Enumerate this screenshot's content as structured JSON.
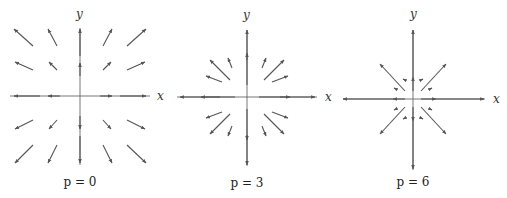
{
  "figure": {
    "color": "#555555",
    "panels": [
      {
        "caption": "p = 0",
        "x_label": "x",
        "y_label": "y",
        "origin": [
          80,
          96
        ],
        "x_axis": [
          10,
          150
        ],
        "y_axis": [
          28,
          165
        ],
        "label_pos": {
          "x": [
            157,
            100
          ],
          "y": [
            76,
            18
          ],
          "caption": [
            80,
            186
          ]
        },
        "vectors": [
          [
            33,
            46,
            14,
            29
          ],
          [
            57,
            46,
            48,
            29
          ],
          [
            103,
            46,
            112,
            29
          ],
          [
            127,
            46,
            146,
            29
          ],
          [
            33,
            70,
            15,
            62
          ],
          [
            57,
            70,
            49,
            62
          ],
          [
            103,
            70,
            111,
            62
          ],
          [
            127,
            70,
            145,
            62
          ],
          [
            33,
            120,
            15,
            129
          ],
          [
            57,
            120,
            49,
            129
          ],
          [
            103,
            120,
            111,
            129
          ],
          [
            127,
            120,
            145,
            129
          ],
          [
            33,
            145,
            15,
            163
          ],
          [
            57,
            145,
            48,
            163
          ],
          [
            103,
            145,
            112,
            163
          ],
          [
            127,
            145,
            146,
            163
          ],
          [
            60,
            96,
            48,
            96
          ],
          [
            40,
            96,
            14,
            96
          ],
          [
            100,
            96,
            112,
            96
          ],
          [
            120,
            96,
            146,
            96
          ],
          [
            80,
            76,
            80,
            63
          ],
          [
            80,
            56,
            80,
            29
          ],
          [
            80,
            116,
            80,
            129
          ],
          [
            80,
            136,
            80,
            163
          ]
        ]
      },
      {
        "caption": "p = 3",
        "x_label": "x",
        "y_label": "y",
        "origin": [
          247,
          97
        ],
        "x_axis": [
          177,
          317
        ],
        "y_axis": [
          30,
          166
        ],
        "label_pos": {
          "x": [
            325,
            101
          ],
          "y": [
            243,
            19
          ],
          "caption": [
            247,
            187
          ]
        },
        "vectors": [
          [
            230,
            80,
            210,
            60
          ],
          [
            232,
            68,
            228,
            58
          ],
          [
            222,
            82,
            206,
            76
          ],
          [
            264,
            80,
            284,
            60
          ],
          [
            262,
            68,
            266,
            58
          ],
          [
            272,
            82,
            288,
            76
          ],
          [
            230,
            114,
            210,
            134
          ],
          [
            232,
            126,
            228,
            136
          ],
          [
            222,
            112,
            206,
            118
          ],
          [
            264,
            114,
            284,
            134
          ],
          [
            262,
            126,
            266,
            136
          ],
          [
            272,
            112,
            288,
            118
          ],
          [
            235,
            97,
            201,
            97
          ],
          [
            220,
            97,
            180,
            97
          ],
          [
            259,
            97,
            290,
            97
          ],
          [
            280,
            97,
            315,
            97
          ],
          [
            247,
            85,
            247,
            53
          ],
          [
            247,
            60,
            247,
            30
          ],
          [
            247,
            109,
            247,
            140
          ],
          [
            247,
            135,
            247,
            165
          ]
        ]
      },
      {
        "caption": "p = 6",
        "x_label": "x",
        "y_label": "y",
        "origin": [
          413,
          99
        ],
        "x_axis": [
          343,
          485
        ],
        "y_axis": [
          30,
          170
        ],
        "label_pos": {
          "x": [
            493,
            103
          ],
          "y": [
            410,
            18
          ],
          "caption": [
            413,
            186
          ]
        },
        "vectors": [
          [
            405,
            91,
            380,
            64
          ],
          [
            405,
            80,
            403,
            79
          ],
          [
            396,
            89,
            394,
            88
          ],
          [
            421,
            91,
            446,
            64
          ],
          [
            421,
            80,
            423,
            79
          ],
          [
            430,
            89,
            432,
            88
          ],
          [
            405,
            107,
            380,
            134
          ],
          [
            405,
            118,
            403,
            119
          ],
          [
            396,
            109,
            394,
            110
          ],
          [
            421,
            107,
            446,
            134
          ],
          [
            421,
            118,
            423,
            119
          ],
          [
            430,
            109,
            432,
            110
          ],
          [
            405,
            99,
            393,
            99
          ],
          [
            393,
            99,
            343,
            99
          ],
          [
            421,
            99,
            436,
            99
          ],
          [
            436,
            99,
            484,
            99
          ],
          [
            413,
            91,
            413,
            77
          ],
          [
            413,
            77,
            413,
            30
          ],
          [
            413,
            107,
            413,
            121
          ],
          [
            413,
            121,
            413,
            169
          ]
        ]
      }
    ]
  }
}
